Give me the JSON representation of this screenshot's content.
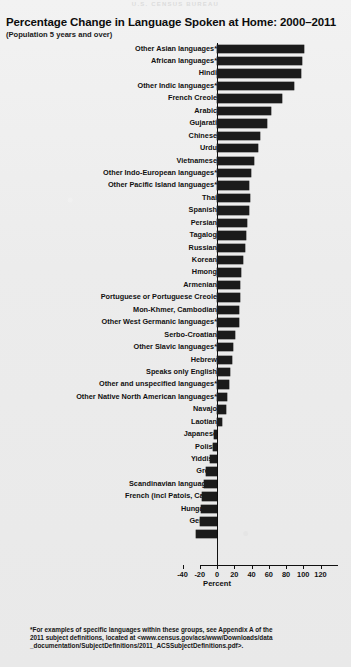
{
  "page": {
    "faint_header": "U.S. CENSUS BUREAU"
  },
  "chart_data": {
    "type": "bar",
    "orientation": "horizontal",
    "title": "Percentage Change in Language Spoken at Home: 2000–2011",
    "subtitle": "(Population 5 years and over)",
    "xlabel": "Percent",
    "ylabel": "",
    "xlim": [
      -40,
      120
    ],
    "xticks": [
      -40,
      -20,
      0,
      20,
      40,
      60,
      80,
      100,
      120
    ],
    "xticklabels": [
      "-40",
      "-20",
      "0",
      "20",
      "40",
      "60",
      "80",
      "100",
      "120"
    ],
    "grid": false,
    "legend": null,
    "bar_color": "#1b1b1b",
    "categories": [
      "Other Asian languages*",
      "African languages*",
      "Hindi",
      "Other Indic languages*",
      "French Creole",
      "Arabic",
      "Gujarati",
      "Chinese",
      "Urdu",
      "Vietnamese",
      "Other Indo-European languages*",
      "Other Pacific Island languages*",
      "Thai",
      "Spanish",
      "Persian",
      "Tagalog",
      "Russian",
      "Korean",
      "Hmong",
      "Armenian",
      "Portuguese or Portuguese Creole",
      "Mon-Khmer, Cambodian",
      "Other West Germanic languages*",
      "Serbo-Croatian",
      "Other Slavic languages*",
      "Hebrew",
      "Speaks only English",
      "Other and unspecified languages*",
      "Other Native North American languages*",
      "Navajo",
      "Laotian",
      "Japanese",
      "Polish",
      "Yiddish",
      "Greek",
      "Scandinavian languages*",
      "French (incl Patois, Cajun)",
      "Hungarian",
      "German",
      "Italian"
    ],
    "values": [
      101,
      99,
      97,
      89,
      75,
      63,
      58,
      50,
      48,
      43,
      39,
      37,
      38,
      37,
      35,
      34,
      32,
      30,
      28,
      27,
      27,
      25,
      26,
      21,
      19,
      17,
      15,
      14,
      12,
      10,
      6,
      -3,
      -5,
      -8,
      -13,
      -15,
      -17,
      -18,
      -20,
      -24
    ]
  },
  "footnote": {
    "line1": "*For examples of specific languages within these groups, see Appendix A of the",
    "line2": "2011 subject definitions, located at <www.census.gov/acs/www/Downloads/data",
    "line3": "_documentation/SubjectDefinitions/2011_ACSSubjectDefinitions.pdf>."
  }
}
